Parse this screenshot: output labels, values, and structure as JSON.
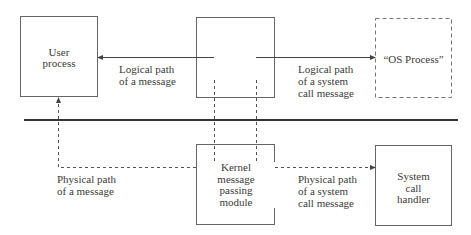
{
  "diagram": {
    "boxes": {
      "user_process": {
        "label": "User\nprocess"
      },
      "kernel_top": {
        "label": ""
      },
      "os_process": {
        "label": "“OS Process”",
        "style": "dashed"
      },
      "kernel_module": {
        "label": "Kernel\nmessage\npassing\nmodule"
      },
      "system_call_handler": {
        "label": "System\ncall\nhandler"
      }
    },
    "edges": {
      "logical_message": {
        "label": "Logical path\nof a message",
        "style": "solid"
      },
      "logical_syscall": {
        "label": "Logical path\nof a system\ncall message",
        "style": "solid"
      },
      "physical_message": {
        "label": "Physical path\nof a message",
        "style": "dashed"
      },
      "physical_syscall": {
        "label": "Physical path\nof a system\ncall message",
        "style": "dashed"
      }
    },
    "divider": {
      "style": "thick solid"
    },
    "colors": {
      "line": "#555555",
      "divider": "#333333",
      "text": "#3a3a3a",
      "background": "#ffffff"
    }
  }
}
